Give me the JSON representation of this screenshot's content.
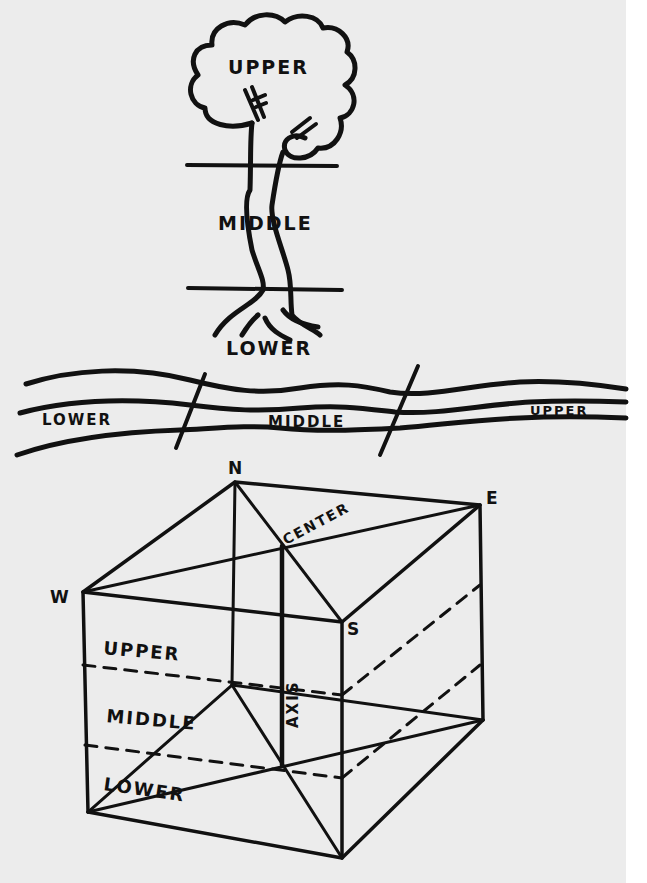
{
  "tree": {
    "labels": {
      "upper": "UPPER",
      "middle": "MIDDLE",
      "lower": "LOWER"
    }
  },
  "river": {
    "labels": {
      "lower": "LOWER",
      "middle": "MIDDLE",
      "upper": "UPPER"
    }
  },
  "cube": {
    "corners": {
      "north": "N",
      "east": "E",
      "west": "W",
      "south": "S"
    },
    "center_label": "CENTER",
    "axis_label": "AXIS",
    "layers": {
      "upper": "UPPER",
      "middle": "MIDDLE",
      "lower": "LOWER"
    }
  },
  "colors": {
    "ink": "#111111",
    "paper": "#ececec",
    "margin": "#ffffff"
  }
}
